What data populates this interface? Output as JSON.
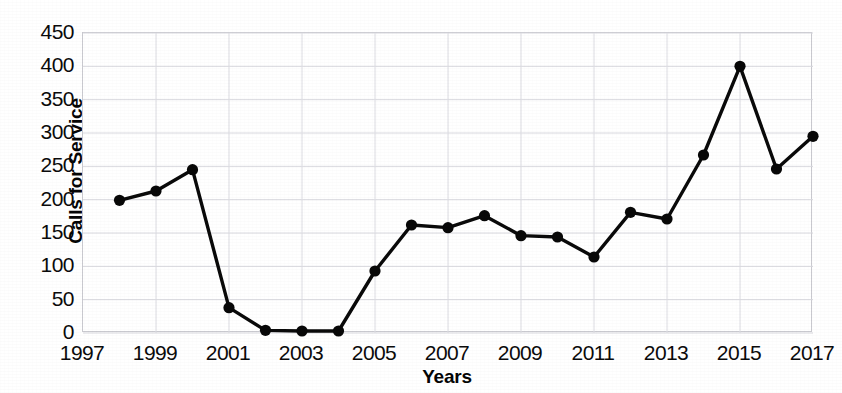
{
  "chart_data": {
    "type": "line",
    "title": "",
    "xlabel": "Years",
    "ylabel": "Calls for Service",
    "x": [
      1998,
      1999,
      2000,
      2001,
      2002,
      2003,
      2004,
      2005,
      2006,
      2007,
      2008,
      2009,
      2010,
      2011,
      2012,
      2013,
      2014,
      2015,
      2016,
      2017
    ],
    "values": [
      199,
      213,
      245,
      38,
      4,
      3,
      3,
      93,
      162,
      158,
      176,
      146,
      144,
      114,
      181,
      171,
      267,
      400,
      246,
      295
    ],
    "series": [
      {
        "name": "Calls for Service",
        "values": [
          199,
          213,
          245,
          38,
          4,
          3,
          3,
          93,
          162,
          158,
          176,
          146,
          144,
          114,
          181,
          171,
          267,
          400,
          246,
          295
        ]
      }
    ],
    "xlim": [
      1997,
      2017
    ],
    "ylim": [
      0,
      450
    ],
    "y_ticks": [
      0,
      50,
      100,
      150,
      200,
      250,
      300,
      350,
      400,
      450
    ],
    "y_tick_labels": [
      "0",
      "50",
      "100",
      "150",
      "200",
      "250",
      "300",
      "350",
      "400",
      "450"
    ],
    "x_ticks": [
      1997,
      1999,
      2001,
      2003,
      2005,
      2007,
      2009,
      2011,
      2013,
      2015,
      2017
    ],
    "x_tick_labels": [
      "1997",
      "1999",
      "2001",
      "2003",
      "2005",
      "2007",
      "2009",
      "2011",
      "2013",
      "2015",
      "2017"
    ],
    "grid": true,
    "grid_axis": "both",
    "legend": false,
    "legend_position": "none",
    "marker": "circle",
    "line_color": "#0a0a0a",
    "marker_color": "#080808",
    "grid_color": "#d8d8de",
    "background_color": "#ffffff"
  }
}
